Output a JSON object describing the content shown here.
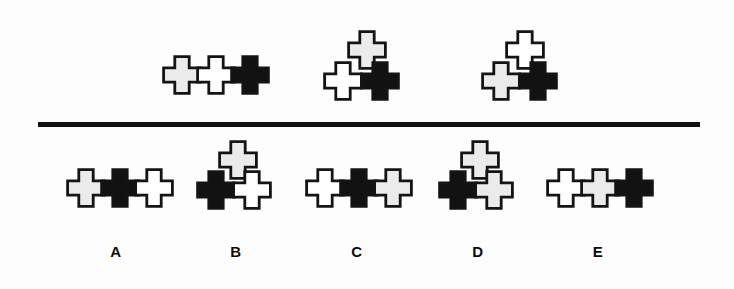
{
  "figure": {
    "type": "non-verbal-reasoning-puzzle",
    "palette": {
      "white": "#ffffff",
      "gray": "#ebebeb",
      "black": "#121212",
      "outline": "#141414",
      "background": "#fdfdfd",
      "divider": "#121212"
    }
  },
  "divider": {
    "name": "horizontal-rule"
  },
  "stem": {
    "groups": [
      {
        "id": "stem-1",
        "layout": "row-of-three",
        "crosses": [
          {
            "fill": "#ebebeb",
            "shade": "gray",
            "x": 162,
            "y": 55
          },
          {
            "fill": "#ffffff",
            "shade": "white",
            "x": 196,
            "y": 55
          },
          {
            "fill": "#121212",
            "shade": "black",
            "x": 230,
            "y": 55
          }
        ]
      },
      {
        "id": "stem-2",
        "layout": "triangle-top-center",
        "crosses": [
          {
            "fill": "#ebebeb",
            "shade": "gray",
            "x": 347,
            "y": 30
          },
          {
            "fill": "#ffffff",
            "shade": "white",
            "x": 323,
            "y": 61
          },
          {
            "fill": "#121212",
            "shade": "black",
            "x": 360,
            "y": 61
          }
        ]
      },
      {
        "id": "stem-3",
        "layout": "triangle-top-center",
        "crosses": [
          {
            "fill": "#ffffff",
            "shade": "white",
            "x": 505,
            "y": 30
          },
          {
            "fill": "#ebebeb",
            "shade": "gray",
            "x": 481,
            "y": 61
          },
          {
            "fill": "#121212",
            "shade": "black",
            "x": 518,
            "y": 61
          }
        ]
      }
    ]
  },
  "options": [
    {
      "id": "option-a",
      "label": "A",
      "label_x": 96,
      "layout": "row-of-three",
      "crosses": [
        {
          "fill": "#ebebeb",
          "shade": "gray",
          "x": 66,
          "y": 168
        },
        {
          "fill": "#121212",
          "shade": "black",
          "x": 100,
          "y": 168
        },
        {
          "fill": "#ffffff",
          "shade": "white",
          "x": 134,
          "y": 168
        }
      ]
    },
    {
      "id": "option-b",
      "label": "B",
      "label_x": 216,
      "layout": "triangle-top-center",
      "crosses": [
        {
          "fill": "#ebebeb",
          "shade": "gray",
          "x": 218,
          "y": 140
        },
        {
          "fill": "#121212",
          "shade": "black",
          "x": 196,
          "y": 170
        },
        {
          "fill": "#ffffff",
          "shade": "white",
          "x": 232,
          "y": 170
        }
      ]
    },
    {
      "id": "option-c",
      "label": "C",
      "label_x": 337,
      "layout": "row-of-three",
      "crosses": [
        {
          "fill": "#ffffff",
          "shade": "white",
          "x": 305,
          "y": 168
        },
        {
          "fill": "#121212",
          "shade": "black",
          "x": 339,
          "y": 168
        },
        {
          "fill": "#ebebeb",
          "shade": "gray",
          "x": 373,
          "y": 168
        }
      ]
    },
    {
      "id": "option-d",
      "label": "D",
      "label_x": 458,
      "layout": "triangle-top-center",
      "crosses": [
        {
          "fill": "#ebebeb",
          "shade": "gray",
          "x": 460,
          "y": 140
        },
        {
          "fill": "#121212",
          "shade": "black",
          "x": 438,
          "y": 170
        },
        {
          "fill": "#ebebeb",
          "shade": "gray",
          "x": 474,
          "y": 170
        }
      ]
    },
    {
      "id": "option-e",
      "label": "E",
      "label_x": 578,
      "layout": "row-of-three",
      "crosses": [
        {
          "fill": "#ffffff",
          "shade": "white",
          "x": 546,
          "y": 168
        },
        {
          "fill": "#ebebeb",
          "shade": "gray",
          "x": 580,
          "y": 168
        },
        {
          "fill": "#121212",
          "shade": "black",
          "x": 614,
          "y": 168
        }
      ]
    }
  ]
}
